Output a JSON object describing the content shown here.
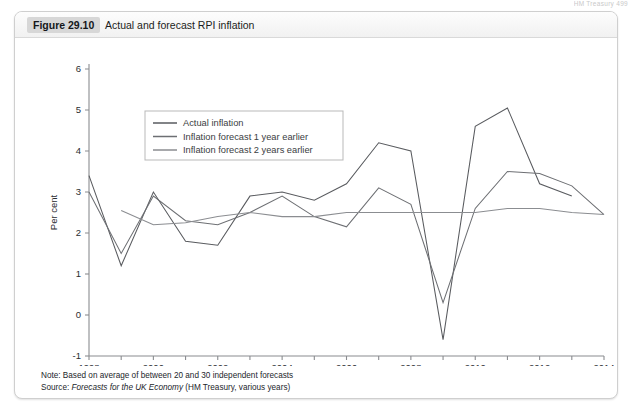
{
  "page_header": "HM Treasury   499",
  "figure": {
    "number_label": "Figure 29.10",
    "title": "Actual and forecast RPI inflation"
  },
  "notes": {
    "note_prefix": "Note: ",
    "note_text": "Based on average of between 20 and 30 independent forecasts",
    "source_prefix": "Source: ",
    "source_italic": "Forecasts for the UK Economy",
    "source_rest": " (HM Treasury, various years)"
  },
  "colors": {
    "actual": "#595b5f",
    "forecast_1yr": "#6d6f73",
    "forecast_2yr": "#8b8d91",
    "axis": "#8a8c90",
    "text": "#2a2d31",
    "legend_border": "#b9b9b9",
    "card_border": "#cfcfcf"
  },
  "chart_data": {
    "type": "line",
    "title": "Actual and forecast RPI inflation",
    "xlabel": "",
    "ylabel": "Per cent",
    "xlim": [
      1998,
      2014
    ],
    "ylim": [
      -1,
      6
    ],
    "ytick_step": 1,
    "yticks": [
      -1,
      0,
      1,
      2,
      3,
      4,
      5,
      6
    ],
    "ytick_labels": [
      "-1",
      "0",
      "1",
      "2",
      "3",
      "4",
      "5",
      "6"
    ],
    "xticks": [
      1998,
      1999,
      2000,
      2001,
      2002,
      2003,
      2004,
      2005,
      2006,
      2007,
      2008,
      2009,
      2010,
      2011,
      2012,
      2013,
      2014
    ],
    "xtick_labels_shown": [
      "1998",
      "2000",
      "2002",
      "2004",
      "2006",
      "2008",
      "2010",
      "2012",
      "2014"
    ],
    "grid": false,
    "legend_position": "upper-left-inside",
    "series": [
      {
        "name": "Actual inflation",
        "color": "#595b5f",
        "x": [
          1998,
          1999,
          2000,
          2001,
          2002,
          2003,
          2004,
          2005,
          2006,
          2007,
          2008,
          2009,
          2010,
          2011,
          2012,
          2013
        ],
        "values": [
          3.4,
          1.2,
          3.0,
          1.8,
          1.7,
          2.9,
          3.0,
          2.8,
          3.2,
          4.2,
          4.0,
          -0.6,
          4.6,
          5.05,
          3.2,
          2.9
        ]
      },
      {
        "name": "Inflation forecast 1 year earlier",
        "color": "#6d6f73",
        "x": [
          1998,
          1999,
          2000,
          2001,
          2002,
          2003,
          2004,
          2005,
          2006,
          2007,
          2008,
          2009,
          2010,
          2011,
          2012,
          2013,
          2014
        ],
        "values": [
          3.0,
          1.5,
          2.9,
          2.3,
          2.2,
          2.5,
          2.9,
          2.4,
          2.15,
          3.1,
          2.7,
          0.3,
          2.6,
          3.5,
          3.45,
          3.15,
          2.45
        ]
      },
      {
        "name": "Inflation forecast 2 years earlier",
        "color": "#8b8d91",
        "x": [
          1999,
          2000,
          2001,
          2002,
          2003,
          2004,
          2005,
          2006,
          2007,
          2008,
          2009,
          2010,
          2011,
          2012,
          2013,
          2014
        ],
        "values": [
          2.55,
          2.2,
          2.25,
          2.4,
          2.5,
          2.4,
          2.4,
          2.5,
          2.5,
          2.5,
          2.5,
          2.5,
          2.6,
          2.6,
          2.5,
          2.45
        ]
      }
    ],
    "legend_entries": [
      "Actual inflation",
      "Inflation forecast 1 year earlier",
      "Inflation forecast 2 years earlier"
    ]
  }
}
